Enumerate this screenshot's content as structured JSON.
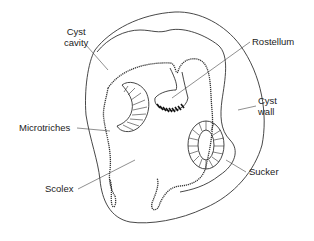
{
  "diagram": {
    "title": "",
    "labels": {
      "cyst_cavity_line1": "Cyst",
      "cyst_cavity_line2": "cavity",
      "rostellum": "Rostellum",
      "cyst_wall_line1": "Cyst",
      "cyst_wall_line2": "wall",
      "microtriches": "Microtriches",
      "scolex": "Scolex",
      "sucker": "Sucker"
    },
    "colors": {
      "line": "#333333",
      "text": "#222222",
      "background": "#ffffff"
    }
  }
}
